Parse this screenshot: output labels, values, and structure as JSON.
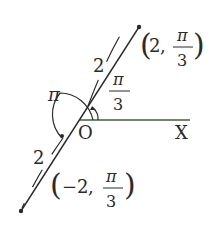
{
  "diagram": {
    "type": "polar-coordinates",
    "origin_label": "O",
    "axis_label": "X",
    "points": [
      {
        "label_r": "2",
        "label_theta_num": "π",
        "label_theta_den": "3",
        "label_open": "(",
        "label_comma": ",",
        "label_close": ")"
      },
      {
        "label_r": "−2",
        "label_theta_num": "π",
        "label_theta_den": "3",
        "label_open": "(",
        "label_comma": ",",
        "label_close": ")"
      }
    ],
    "distance_labels": [
      "2",
      "2"
    ],
    "angle_labels": {
      "pi": "π",
      "pi_over_3_num": "π",
      "pi_over_3_den": "3"
    },
    "colors": {
      "line": "#2a2a2a",
      "axis": "#4a5a3a"
    }
  }
}
